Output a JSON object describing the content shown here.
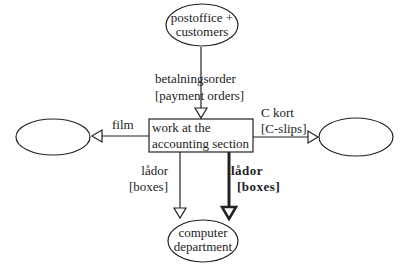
{
  "nodes": {
    "source": {
      "line1": "postoffice +",
      "line2": "customers"
    },
    "process": {
      "line1": "work at the",
      "line2": "accounting section"
    },
    "left_sink": {
      "label": ""
    },
    "right_sink": {
      "label": ""
    },
    "computer": {
      "line1": "computer",
      "line2": "department"
    }
  },
  "flows": {
    "payment": {
      "line1": "betalningsorder",
      "line2": "[payment orders]"
    },
    "film": {
      "label": "film"
    },
    "cslips": {
      "line1": "C kort",
      "line2": "[C-slips]"
    },
    "boxes_thin": {
      "line1": "lådor",
      "line2": "[boxes]"
    },
    "boxes_bold": {
      "line1": "lådor",
      "line2": "[boxes]"
    }
  },
  "colors": {
    "stroke": "#222222",
    "background": "#ffffff"
  }
}
